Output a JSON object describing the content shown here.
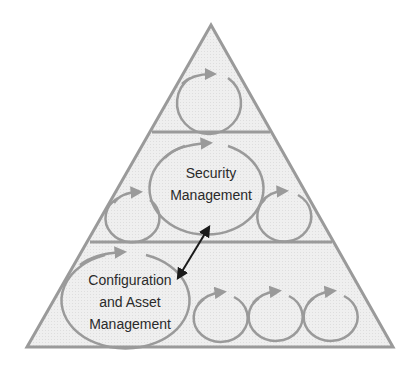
{
  "diagram": {
    "type": "pyramid",
    "levels": 3,
    "colors": {
      "fill": "#ececec",
      "outline": "#9a9a9a",
      "cycle": "#9a9a9a",
      "arrow": "#1a1a1a",
      "text": "#2a2a2a"
    },
    "top_level": {
      "cycles": 1
    },
    "middle_level": {
      "primary_label_line1": "Security",
      "primary_label_line2": "Management",
      "side_cycles": 2
    },
    "bottom_level": {
      "primary_label_line1": "Configuration",
      "primary_label_line2": "and Asset",
      "primary_label_line3": "Management",
      "side_cycles": 3
    },
    "connector": {
      "type": "double-headed-arrow",
      "from": "Security Management",
      "to": "Configuration and Asset Management"
    }
  }
}
